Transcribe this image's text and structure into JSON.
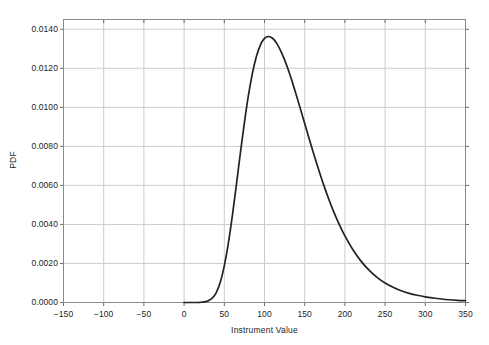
{
  "chart_data": {
    "type": "line",
    "title": "",
    "subtitle": "",
    "xlabel": "Instrument Value",
    "ylabel": "PDF",
    "xlim": [
      -150,
      350
    ],
    "ylim": [
      0.0,
      0.0145
    ],
    "xticks": [
      -150,
      -100,
      -50,
      0,
      50,
      100,
      150,
      200,
      250,
      300,
      350
    ],
    "xtick_labels": [
      "−150",
      "−100",
      "−50",
      "0",
      "50",
      "100",
      "150",
      "200",
      "250",
      "300",
      "350"
    ],
    "yticks": [
      0.0,
      0.002,
      0.004,
      0.006,
      0.008,
      0.01,
      0.012,
      0.014
    ],
    "ytick_labels": [
      "0.0000",
      "0.0020",
      "0.0040",
      "0.0060",
      "0.0080",
      "0.0100",
      "0.0120",
      "0.0140"
    ],
    "grid": true,
    "legend": null,
    "legend_position": "none",
    "line_color": "#222222",
    "grid_color": "#cccccc",
    "frame_color": "#888888",
    "background_color": "#ffffff",
    "annotations": [],
    "series": [
      {
        "name": "PDF",
        "color": "#222222",
        "x": [
          0,
          5,
          10,
          15,
          20,
          25,
          30,
          35,
          40,
          45,
          50,
          55,
          60,
          65,
          70,
          75,
          80,
          85,
          90,
          95,
          100,
          105,
          110,
          115,
          120,
          125,
          130,
          135,
          140,
          145,
          150,
          155,
          160,
          165,
          170,
          175,
          180,
          185,
          190,
          195,
          200,
          210,
          220,
          230,
          240,
          250,
          260,
          270,
          280,
          290,
          300,
          310,
          320,
          330,
          340,
          350
        ],
        "y": [
          0.0,
          0.0,
          0.0,
          0.0,
          1e-05,
          3e-05,
          9e-05,
          0.00022,
          0.00051,
          0.00104,
          0.00188,
          0.00303,
          0.00444,
          0.00603,
          0.00766,
          0.00922,
          0.01061,
          0.01175,
          0.01262,
          0.0132,
          0.01353,
          0.01363,
          0.01354,
          0.01329,
          0.01291,
          0.01243,
          0.01187,
          0.01124,
          0.01057,
          0.00987,
          0.00917,
          0.00847,
          0.00778,
          0.00711,
          0.00647,
          0.00586,
          0.00529,
          0.00476,
          0.00427,
          0.00382,
          0.00341,
          0.0027,
          0.00212,
          0.00166,
          0.00129,
          0.001,
          0.00078,
          0.0006,
          0.00047,
          0.00037,
          0.00029,
          0.00023,
          0.00018,
          0.00014,
          0.00011,
          9e-05
        ],
        "peak_x": 105,
        "peak_y": 0.01363
      }
    ]
  },
  "axes": {
    "x_axis_label": "Instrument Value",
    "y_axis_label": "PDF"
  }
}
